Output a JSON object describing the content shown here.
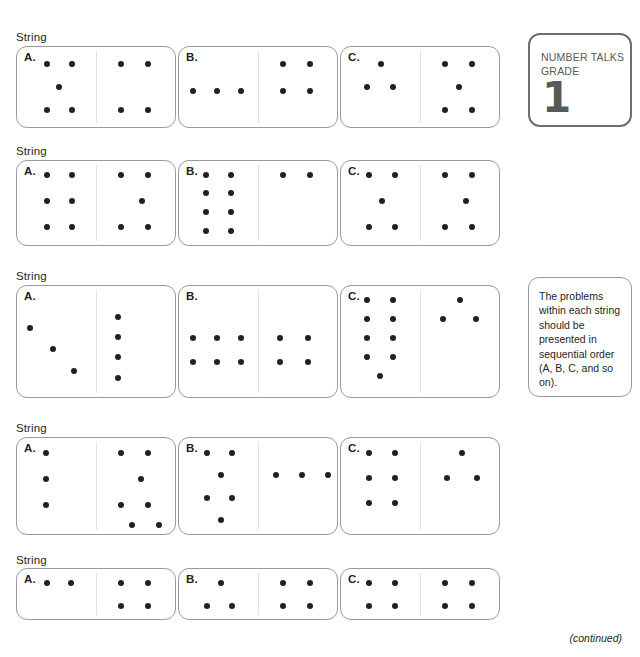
{
  "badge": {
    "line1": "NUMBER TALKS",
    "line2": "GRADE",
    "number": "1"
  },
  "note": {
    "text": "The problems within each string should be presented in sequential order (A, B, C, and so on)."
  },
  "footer": {
    "continued": "(continued)"
  },
  "string_label": "String",
  "card_geometry": {
    "width": 160,
    "left_offsets": [
      16,
      178,
      340
    ]
  },
  "strings": [
    {
      "label": "String",
      "label_y": 31,
      "cards_y": 46,
      "card_height": 82,
      "cards": [
        {
          "letter": "A.",
          "left_dots": [
            [
              30,
              17
            ],
            [
              55,
              17
            ],
            [
              42,
              40
            ],
            [
              30,
              63
            ],
            [
              55,
              63
            ]
          ],
          "right_dots": [
            [
              25,
              17
            ],
            [
              52,
              17
            ],
            [
              25,
              63
            ],
            [
              52,
              63
            ]
          ]
        },
        {
          "letter": "B.",
          "left_dots": [
            [
              14,
              44
            ],
            [
              38,
              44
            ],
            [
              62,
              44
            ]
          ],
          "right_dots": [
            [
              25,
              17
            ],
            [
              52,
              17
            ],
            [
              25,
              44
            ],
            [
              52,
              44
            ]
          ]
        },
        {
          "letter": "C.",
          "left_dots": [
            [
              40,
              17
            ],
            [
              26,
              40
            ],
            [
              52,
              40
            ]
          ],
          "right_dots": [
            [
              25,
              17
            ],
            [
              52,
              17
            ],
            [
              39,
              40
            ],
            [
              25,
              63
            ],
            [
              52,
              63
            ]
          ]
        }
      ]
    },
    {
      "label": "String",
      "label_y": 145,
      "cards_y": 160,
      "card_height": 86,
      "cards": [
        {
          "letter": "A.",
          "left_dots": [
            [
              30,
              14
            ],
            [
              55,
              14
            ],
            [
              30,
              40
            ],
            [
              55,
              40
            ],
            [
              30,
              66
            ],
            [
              55,
              66
            ]
          ],
          "right_dots": [
            [
              25,
              14
            ],
            [
              52,
              14
            ],
            [
              46,
              40
            ],
            [
              25,
              66
            ],
            [
              52,
              66
            ]
          ]
        },
        {
          "letter": "B.",
          "left_dots": [
            [
              27,
              14
            ],
            [
              52,
              14
            ],
            [
              27,
              32
            ],
            [
              52,
              32
            ],
            [
              27,
              51
            ],
            [
              52,
              51
            ],
            [
              27,
              70
            ],
            [
              52,
              70
            ]
          ],
          "right_dots": [
            [
              25,
              14
            ],
            [
              52,
              14
            ]
          ]
        },
        {
          "letter": "C.",
          "left_dots": [
            [
              28,
              14
            ],
            [
              54,
              14
            ],
            [
              41,
              40
            ],
            [
              28,
              66
            ],
            [
              54,
              66
            ]
          ],
          "right_dots": [
            [
              25,
              14
            ],
            [
              52,
              14
            ],
            [
              46,
              40
            ],
            [
              25,
              66
            ],
            [
              52,
              66
            ]
          ]
        }
      ]
    },
    {
      "label": "String",
      "label_y": 270,
      "cards_y": 285,
      "card_height": 113,
      "cards": [
        {
          "letter": "A.",
          "left_dots": [
            [
              13,
              42
            ],
            [
              36,
              63
            ],
            [
              57,
              85
            ]
          ],
          "right_dots": [
            [
              22,
              31
            ],
            [
              22,
              51
            ],
            [
              22,
              71
            ],
            [
              22,
              92
            ]
          ]
        },
        {
          "letter": "B.",
          "left_dots": [
            [
              14,
              52
            ],
            [
              38,
              52
            ],
            [
              62,
              52
            ],
            [
              14,
              76
            ],
            [
              38,
              76
            ],
            [
              62,
              76
            ]
          ],
          "right_dots": [
            [
              22,
              52
            ],
            [
              50,
              52
            ],
            [
              22,
              76
            ],
            [
              50,
              76
            ]
          ]
        },
        {
          "letter": "C.",
          "left_dots": [
            [
              26,
              14
            ],
            [
              52,
              14
            ],
            [
              26,
              33
            ],
            [
              52,
              33
            ],
            [
              26,
              52
            ],
            [
              52,
              52
            ],
            [
              26,
              71
            ],
            [
              52,
              71
            ],
            [
              39,
              90
            ]
          ],
          "right_dots": [
            [
              40,
              14
            ],
            [
              23,
              33
            ],
            [
              56,
              33
            ]
          ]
        }
      ]
    },
    {
      "label": "String",
      "label_y": 422,
      "cards_y": 437,
      "card_height": 98,
      "cards": [
        {
          "letter": "A.",
          "left_dots": [
            [
              29,
              15
            ],
            [
              29,
              41
            ],
            [
              29,
              67
            ]
          ],
          "right_dots": [
            [
              25,
              15
            ],
            [
              52,
              15
            ],
            [
              45,
              41
            ],
            [
              25,
              67
            ],
            [
              52,
              67
            ],
            [
              36,
              87
            ],
            [
              63,
              87
            ]
          ]
        },
        {
          "letter": "B.",
          "left_dots": [
            [
              28,
              15
            ],
            [
              53,
              15
            ],
            [
              42,
              37
            ],
            [
              28,
              60
            ],
            [
              53,
              60
            ],
            [
              42,
              82
            ]
          ],
          "right_dots": [
            [
              18,
              37
            ],
            [
              44,
              37
            ],
            [
              70,
              37
            ]
          ]
        },
        {
          "letter": "C.",
          "left_dots": [
            [
              28,
              15
            ],
            [
              54,
              15
            ],
            [
              28,
              40
            ],
            [
              54,
              40
            ],
            [
              28,
              65
            ],
            [
              54,
              65
            ]
          ],
          "right_dots": [
            [
              42,
              15
            ],
            [
              27,
              40
            ],
            [
              57,
              40
            ]
          ]
        }
      ]
    },
    {
      "label": "String",
      "label_y": 554,
      "cards_y": 568,
      "card_height": 52,
      "cards": [
        {
          "letter": "A.",
          "left_dots": [
            [
              30,
              14
            ],
            [
              54,
              14
            ]
          ],
          "right_dots": [
            [
              25,
              14
            ],
            [
              52,
              14
            ],
            [
              25,
              37
            ],
            [
              52,
              37
            ]
          ]
        },
        {
          "letter": "B.",
          "left_dots": [
            [
              42,
              14
            ],
            [
              28,
              37
            ],
            [
              53,
              37
            ]
          ],
          "right_dots": [
            [
              25,
              14
            ],
            [
              52,
              14
            ],
            [
              25,
              37
            ],
            [
              52,
              37
            ]
          ]
        },
        {
          "letter": "C.",
          "left_dots": [
            [
              28,
              14
            ],
            [
              54,
              14
            ],
            [
              28,
              37
            ],
            [
              54,
              37
            ]
          ],
          "right_dots": [
            [
              25,
              14
            ],
            [
              52,
              14
            ],
            [
              25,
              37
            ],
            [
              52,
              37
            ]
          ]
        }
      ]
    }
  ]
}
